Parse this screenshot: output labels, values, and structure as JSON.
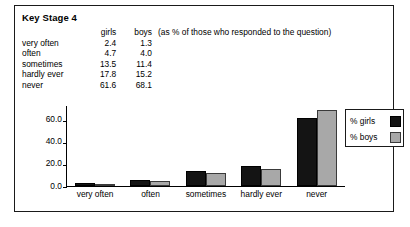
{
  "title": "Key Stage 4",
  "note": "(as % of those who responded to the question)",
  "table": {
    "category_header": "",
    "headers": [
      "girls",
      "boys"
    ],
    "rows": [
      {
        "category": "very often",
        "girls": "2.4",
        "boys": "1.3"
      },
      {
        "category": "often",
        "girls": "4.7",
        "boys": "4.0"
      },
      {
        "category": "sometimes",
        "girls": "13.5",
        "boys": "11.4"
      },
      {
        "category": "hardly ever",
        "girls": "17.8",
        "boys": "15.2"
      },
      {
        "category": "never",
        "girls": "61.6",
        "boys": "68.1"
      }
    ]
  },
  "legend": {
    "items": [
      {
        "label": "% girls",
        "color": "#141414"
      },
      {
        "label": "% boys",
        "color": "#a8a8a8"
      }
    ]
  },
  "chart_data": {
    "type": "bar",
    "title": "",
    "xlabel": "",
    "ylabel": "",
    "categories": [
      "very often",
      "often",
      "sometimes",
      "hardly ever",
      "never"
    ],
    "series": [
      {
        "name": "% girls",
        "color": "#141414",
        "values": [
          2.4,
          4.7,
          13.5,
          17.8,
          61.6
        ]
      },
      {
        "name": "% boys",
        "color": "#a8a8a8",
        "values": [
          1.3,
          4.0,
          11.4,
          15.2,
          68.1
        ]
      }
    ],
    "yticks": [
      "0.0",
      "20.0",
      "40.0",
      "60.0"
    ],
    "ytick_values": [
      0,
      20,
      40,
      60
    ],
    "ylim": [
      0,
      72
    ],
    "grid": false,
    "legend_position": "right"
  }
}
